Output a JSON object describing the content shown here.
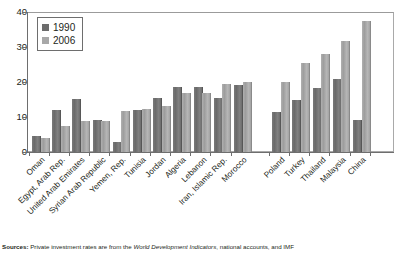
{
  "chart_data": {
    "type": "bar",
    "title": "",
    "subtitle": "",
    "xlabel": "",
    "ylabel": "",
    "ylim": [
      0,
      40
    ],
    "yticks": [
      0,
      10,
      20,
      30,
      40
    ],
    "grid": false,
    "legend_position": "top-left",
    "categories": [
      "Oman",
      "Egypt, Arab Rep.",
      "United Arab Emirates",
      "Syrian Arab Republic",
      "Yemen, Rep.",
      "Tunisia",
      "Jordan",
      "Algeria",
      "Lebanon",
      "Iran, Islamic Rep.",
      "Morocco",
      "Poland",
      "Turkey",
      "Thailand",
      "Malaysia",
      "China"
    ],
    "group_break_after": "Morocco",
    "series": [
      {
        "name": "1990",
        "color": "#6c6c6c",
        "values": [
          4.5,
          12.0,
          15.2,
          9.2,
          2.8,
          12.0,
          15.5,
          18.5,
          18.5,
          15.5,
          19.2,
          11.5,
          15.0,
          18.2,
          21.0,
          9.2
        ]
      },
      {
        "name": "2006",
        "color": "#a8a8a8",
        "values": [
          4.0,
          7.5,
          9.0,
          9.0,
          11.8,
          12.3,
          13.2,
          16.8,
          17.0,
          19.5,
          20.0,
          20.0,
          25.5,
          28.0,
          31.8,
          37.5
        ]
      }
    ]
  },
  "legend": {
    "entries": [
      {
        "label": "1990",
        "swatch": "dark-gray-swatch"
      },
      {
        "label": "2006",
        "swatch": "light-gray-swatch"
      }
    ]
  },
  "source_note": {
    "prefix": "Sources:",
    "text_before_italic": " Private investment rates are from the ",
    "italic": "World Development Indicators",
    "text_after_italic": ", national accounts, and IMF"
  }
}
